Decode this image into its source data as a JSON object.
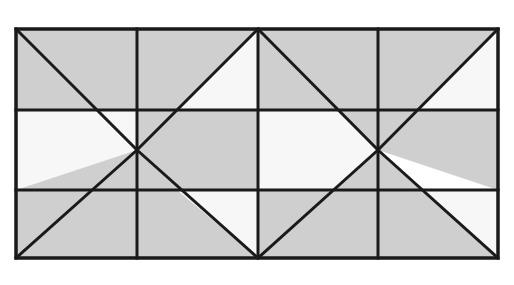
{
  "figure": {
    "title": "Geometric tiled pattern of gray and white triangles",
    "type": "geometric-tiling",
    "canvas": {
      "width": 514,
      "height": 285
    },
    "colors": {
      "background": "#ffffff",
      "fill_gray": "#cfcfcf",
      "fill_white": "#f7f7f7",
      "stroke": "#1a1a1a"
    },
    "stroke_width": 3,
    "bounds": {
      "left": 16,
      "top": 29,
      "right": 498,
      "bottom": 258
    },
    "grid": {
      "vertical_lines_x": [
        16,
        137,
        258,
        378,
        498
      ],
      "horizontal_lines_y": [
        29,
        110,
        190,
        258
      ],
      "column_count": 4,
      "row_count": 3
    },
    "diagonal_centers": [
      {
        "x": 137,
        "y": 150
      },
      {
        "x": 378,
        "y": 150
      }
    ],
    "diagonals": [
      {
        "name": "left-x-upper-left",
        "x1": 16,
        "y1": 29,
        "x2": 137,
        "y2": 150
      },
      {
        "name": "left-x-upper-right",
        "x1": 258,
        "y1": 29,
        "x2": 137,
        "y2": 150
      },
      {
        "name": "left-x-lower-left",
        "x1": 16,
        "y1": 258,
        "x2": 137,
        "y2": 150
      },
      {
        "name": "left-x-lower-right",
        "x1": 258,
        "y1": 258,
        "x2": 137,
        "y2": 150
      },
      {
        "name": "right-x-upper-left",
        "x1": 258,
        "y1": 29,
        "x2": 378,
        "y2": 150
      },
      {
        "name": "right-x-upper-right",
        "x1": 498,
        "y1": 29,
        "x2": 378,
        "y2": 150
      },
      {
        "name": "right-x-lower-left",
        "x1": 258,
        "y1": 258,
        "x2": 378,
        "y2": 150
      },
      {
        "name": "right-x-lower-right",
        "x1": 498,
        "y1": 258,
        "x2": 378,
        "y2": 150
      }
    ],
    "regions": [
      {
        "name": "r1",
        "fill": "gray",
        "points": "16,29 137,29 137,110 16,110 16,29"
      },
      {
        "name": "r2",
        "fill": "gray",
        "points": "137,29 258,29 137,150 137,29"
      },
      {
        "name": "r3",
        "fill": "gray",
        "points": "137,110 137,150 97,110 137,110"
      },
      {
        "name": "r4",
        "fill": "white",
        "points": "16,110 137,110 137,150 16,190 16,110"
      },
      {
        "name": "r5",
        "fill": "gray",
        "points": "16,190 137,150 137,190 16,190"
      },
      {
        "name": "r6",
        "fill": "gray",
        "points": "16,190 137,190 137,258 16,258 16,190"
      },
      {
        "name": "r7",
        "fill": "gray",
        "points": "137,150 258,258 137,258 137,150"
      },
      {
        "name": "r8",
        "fill": "white",
        "points": "177,110 258,29 258,110 177,110"
      },
      {
        "name": "r9",
        "fill": "gray",
        "points": "258,29 258,110 338,110 258,29"
      },
      {
        "name": "r10",
        "fill": "gray",
        "points": "137,150 177,110 258,110 258,190 137,190 137,150"
      },
      {
        "name": "r11",
        "fill": "white",
        "points": "258,110 338,110 378,150 338,190 258,190 258,110"
      },
      {
        "name": "r12",
        "fill": "white",
        "points": "177,190 258,190 258,258 177,190"
      },
      {
        "name": "r13",
        "fill": "gray",
        "points": "258,190 338,190 258,258 258,190"
      },
      {
        "name": "r14",
        "fill": "gray",
        "points": "258,29 378,150 338,110 258,29"
      },
      {
        "name": "r15",
        "fill": "gray",
        "points": "378,29 378,150 498,29 378,29"
      },
      {
        "name": "r16",
        "fill": "gray",
        "points": "258,29 378,29 378,150 258,29"
      },
      {
        "name": "r17",
        "fill": "white",
        "points": "418,110 498,29 498,110 418,110"
      },
      {
        "name": "r18",
        "fill": "gray",
        "points": "378,150 418,110 498,110 498,190 378,150"
      },
      {
        "name": "r19",
        "fill": "white",
        "points": "418,190 498,190 498,258 418,190"
      },
      {
        "name": "r20",
        "fill": "gray",
        "points": "378,150 498,258 418,190 378,150"
      },
      {
        "name": "r21",
        "fill": "gray",
        "points": "258,258 378,150 378,258 258,258"
      },
      {
        "name": "r22",
        "fill": "gray",
        "points": "378,150 378,258 498,258 378,150"
      }
    ]
  }
}
